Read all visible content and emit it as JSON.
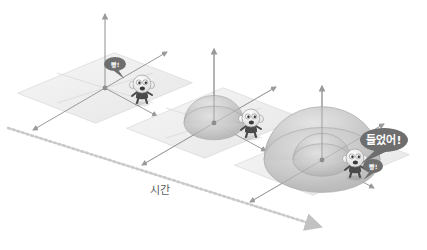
{
  "diagram": {
    "background": "#ffffff",
    "time_axis": {
      "label": "시간",
      "style": "dashed-arrow",
      "color": "#c9c9c9",
      "label_color": "#5d5d5d",
      "x1": 8,
      "y1": 128,
      "x2": 318,
      "y2": 226
    },
    "colors": {
      "plane_fill": "#efefef",
      "plane_stroke": "#d8d8d8",
      "axis": "#9a9a9a",
      "wave_fill": "#c4c4c4",
      "wave_stroke": "#a8a8a8",
      "bubble_fill": "#6e6e6e",
      "bubble_text": "#ffffff",
      "character_body": "#4a4a4a",
      "character_head": "#f2f2f2"
    },
    "stages": [
      {
        "id": "stage-1",
        "order": 1,
        "origin_x": 105,
        "origin_y": 88,
        "plane_w": 92,
        "plane_h": 44,
        "wave_radius": 0,
        "wave_rings": 0,
        "character": {
          "x": 142,
          "y": 90,
          "scale": 1.0
        },
        "bubbles": [
          {
            "name": "bang-bubble",
            "text": "빵!",
            "x": 115,
            "y": 64,
            "rx": 11,
            "ry": 7,
            "font_size": 6,
            "tail": "down-right"
          }
        ]
      },
      {
        "id": "stage-2",
        "order": 2,
        "origin_x": 214,
        "origin_y": 123,
        "plane_w": 92,
        "plane_h": 44,
        "wave_radius": 30,
        "wave_rings": 1,
        "character": {
          "x": 251,
          "y": 124,
          "scale": 1.0
        },
        "bubbles": []
      },
      {
        "id": "stage-3",
        "order": 3,
        "origin_x": 322,
        "origin_y": 160,
        "plane_w": 92,
        "plane_h": 44,
        "wave_radius": 58,
        "wave_rings": 2,
        "character": {
          "x": 355,
          "y": 164,
          "scale": 1.0
        },
        "bubbles": [
          {
            "name": "heard-bubble",
            "text": "들었어!",
            "x": 384,
            "y": 140,
            "rx": 24,
            "ry": 12,
            "font_size": 11,
            "tail": "down-left"
          },
          {
            "name": "bang-bubble",
            "text": "빵!",
            "x": 373,
            "y": 166,
            "rx": 10,
            "ry": 7,
            "font_size": 6,
            "tail": "down-left"
          }
        ]
      }
    ]
  }
}
